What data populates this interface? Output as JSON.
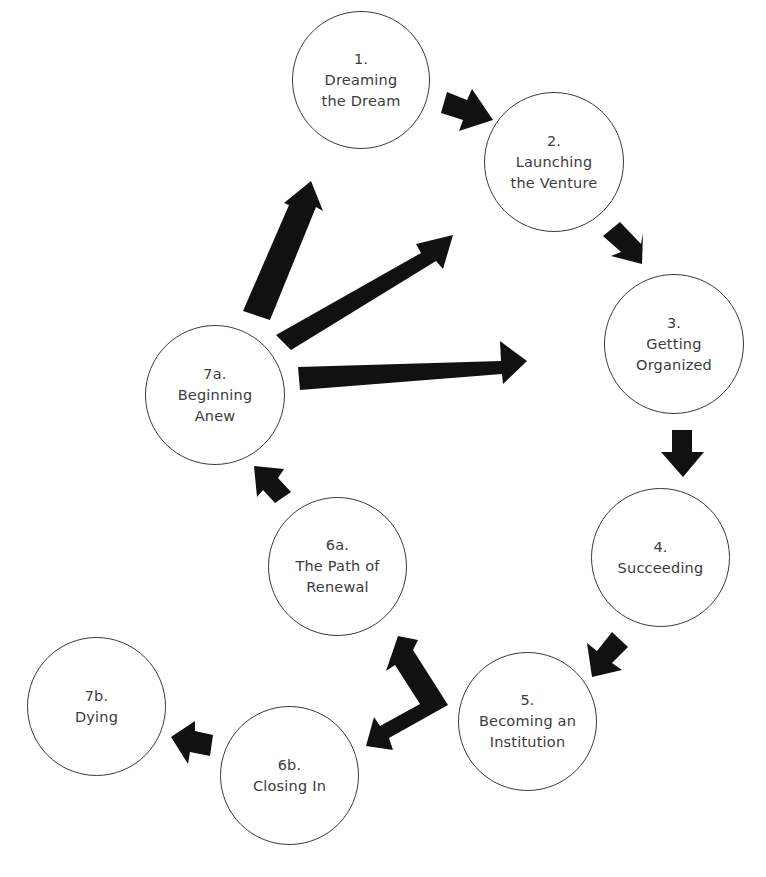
{
  "diagram": {
    "type": "lifecycle-cycle",
    "nodes": [
      {
        "id": "n1",
        "number": "1.",
        "line1": "Dreaming",
        "line2": "the Dream",
        "cx": 361,
        "cy": 80,
        "r": 69
      },
      {
        "id": "n2",
        "number": "2.",
        "line1": "Launching",
        "line2": "the Venture",
        "cx": 553,
        "cy": 163,
        "r": 69
      },
      {
        "id": "n3",
        "number": "3.",
        "line1": "Getting",
        "line2": "Organized",
        "cx": 673,
        "cy": 345,
        "r": 69
      },
      {
        "id": "n4",
        "number": "4.",
        "line1": "Succeeding",
        "line2": "",
        "cx": 655,
        "cy": 558,
        "r": 69
      },
      {
        "id": "n5",
        "number": "5.",
        "line1": "Becoming an",
        "line2": "Institution",
        "cx": 527,
        "cy": 721,
        "r": 69
      },
      {
        "id": "n6a",
        "number": "6a.",
        "line1": "The Path of",
        "line2": "Renewal",
        "cx": 338,
        "cy": 563,
        "r": 69
      },
      {
        "id": "n6b",
        "number": "6b.",
        "line1": "Closing In",
        "line2": "",
        "cx": 289,
        "cy": 776,
        "r": 69
      },
      {
        "id": "n7a",
        "number": "7a.",
        "line1": "Beginning",
        "line2": "Anew",
        "cx": 213,
        "cy": 390,
        "r": 70
      },
      {
        "id": "n7b",
        "number": "7b.",
        "line1": "Dying",
        "line2": "",
        "cx": 96,
        "cy": 706,
        "r": 70
      }
    ],
    "arrows": [
      {
        "from": "1",
        "to": "2",
        "style": "short-block"
      },
      {
        "from": "2",
        "to": "3",
        "style": "short-block"
      },
      {
        "from": "3",
        "to": "4",
        "style": "short-block"
      },
      {
        "from": "4",
        "to": "5",
        "style": "short-block"
      },
      {
        "from": "5",
        "to": "6a",
        "style": "forked-block"
      },
      {
        "from": "5",
        "to": "6b",
        "style": "forked-block"
      },
      {
        "from": "6a",
        "to": "7a",
        "style": "short-block"
      },
      {
        "from": "6b",
        "to": "7b",
        "style": "short-block"
      },
      {
        "from": "7a",
        "to": "1",
        "style": "long-block"
      },
      {
        "from": "7a",
        "to": "2",
        "style": "long-block"
      },
      {
        "from": "7a",
        "to": "3",
        "style": "long-block"
      }
    ],
    "colors": {
      "arrow": "#111111",
      "circle_stroke": "#3a3a3a",
      "text": "#3c3c3c",
      "background": "#ffffff"
    }
  }
}
